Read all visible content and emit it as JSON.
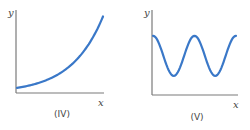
{
  "chart_data": [
    {
      "type": "line",
      "panel_label": "(IV)",
      "title": "",
      "xlabel": "x",
      "ylabel": "y",
      "description": "Exponential growth curve",
      "function": "exponential",
      "x": [
        0,
        0.1,
        0.2,
        0.3,
        0.4,
        0.5,
        0.6,
        0.7,
        0.8,
        0.9,
        1.0
      ],
      "y": [
        0.06,
        0.08,
        0.1,
        0.13,
        0.17,
        0.22,
        0.29,
        0.38,
        0.5,
        0.67,
        0.9
      ],
      "xlim": [
        0,
        1
      ],
      "ylim": [
        0,
        1
      ],
      "grid": false,
      "line_color": "#3a78c8"
    },
    {
      "type": "line",
      "panel_label": "(V)",
      "title": "",
      "xlabel": "x",
      "ylabel": "y",
      "description": "Periodic oscillation (cosine-like wave), two full cycles",
      "function": "periodic",
      "x": [
        0,
        0.125,
        0.25,
        0.375,
        0.5,
        0.625,
        0.75,
        0.875,
        1.0
      ],
      "y": [
        0.68,
        0.45,
        0.22,
        0.45,
        0.68,
        0.45,
        0.22,
        0.45,
        0.68
      ],
      "xlim": [
        0,
        1
      ],
      "ylim": [
        0,
        1
      ],
      "grid": false,
      "line_color": "#3a78c8"
    }
  ]
}
